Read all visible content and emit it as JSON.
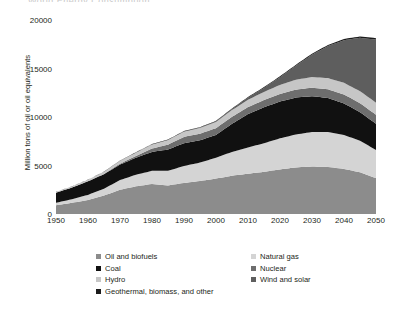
{
  "title_crop": "World Energy Consumption",
  "axis": {
    "ylabel": "Million tons of oil or oil equivalents",
    "yticks": [
      "0",
      "5000",
      "10000",
      "15000",
      "20000"
    ],
    "xticks": [
      "1950",
      "1960",
      "1970",
      "1980",
      "1990",
      "2000",
      "2010",
      "2020",
      "2030",
      "2040",
      "2050"
    ]
  },
  "legend": {
    "left": [
      {
        "label": "Oil and biofuels",
        "color": "#8c8c8c"
      },
      {
        "label": "Coal",
        "color": "#111111"
      },
      {
        "label": "Hydro",
        "color": "#c6c6c6"
      },
      {
        "label": "Geothermal, biomass, and other",
        "color": "#1c1c1c"
      }
    ],
    "right": [
      {
        "label": "Natural gas",
        "color": "#d4d4d4"
      },
      {
        "label": "Nuclear",
        "color": "#6e6e6e"
      },
      {
        "label": "Wind and solar",
        "color": "#5e5e5e"
      }
    ]
  },
  "chart_data": {
    "type": "area",
    "stacked": true,
    "title": "World Energy Consumption",
    "xlabel": "",
    "ylabel": "Million tons of oil or oil equivalents",
    "xlim": [
      1950,
      2050
    ],
    "ylim": [
      0,
      20000
    ],
    "grid": false,
    "legend_position": "bottom",
    "x": [
      1950,
      1955,
      1960,
      1965,
      1970,
      1975,
      1980,
      1985,
      1990,
      1995,
      2000,
      2005,
      2010,
      2015,
      2020,
      2025,
      2030,
      2035,
      2040,
      2045,
      2050
    ],
    "series": [
      {
        "name": "Oil and biofuels",
        "color": "#8c8c8c",
        "values": [
          900,
          1150,
          1450,
          1900,
          2500,
          2850,
          3100,
          2950,
          3200,
          3400,
          3650,
          3950,
          4150,
          4350,
          4600,
          4800,
          4900,
          4850,
          4650,
          4300,
          3700
        ]
      },
      {
        "name": "Natural gas",
        "color": "#d4d4d4",
        "values": [
          250,
          380,
          520,
          700,
          1000,
          1200,
          1350,
          1500,
          1750,
          1900,
          2150,
          2450,
          2700,
          2950,
          3200,
          3400,
          3550,
          3600,
          3500,
          3250,
          2900
        ]
      },
      {
        "name": "Coal",
        "color": "#111111",
        "values": [
          1050,
          1200,
          1400,
          1500,
          1600,
          1750,
          1950,
          2200,
          2350,
          2300,
          2350,
          2900,
          3450,
          3700,
          3800,
          3800,
          3700,
          3500,
          3250,
          2950,
          2700
        ]
      },
      {
        "name": "Nuclear",
        "color": "#6e6e6e",
        "values": [
          0,
          0,
          10,
          30,
          90,
          180,
          350,
          500,
          650,
          680,
          700,
          720,
          720,
          740,
          780,
          820,
          870,
          900,
          920,
          930,
          930
        ]
      },
      {
        "name": "Hydro",
        "color": "#c6c6c6",
        "values": [
          80,
          110,
          160,
          220,
          290,
          360,
          420,
          480,
          540,
          590,
          640,
          690,
          760,
          840,
          930,
          1020,
          1100,
          1160,
          1200,
          1230,
          1250
        ]
      },
      {
        "name": "Wind and solar",
        "color": "#5e5e5e",
        "values": [
          0,
          0,
          0,
          0,
          0,
          0,
          5,
          10,
          20,
          35,
          60,
          110,
          210,
          420,
          800,
          1450,
          2300,
          3300,
          4400,
          5500,
          6500
        ]
      },
      {
        "name": "Geothermal, biomass, and other",
        "color": "#1c1c1c",
        "values": [
          10,
          12,
          15,
          20,
          25,
          30,
          35,
          40,
          45,
          50,
          55,
          60,
          70,
          80,
          90,
          100,
          110,
          120,
          130,
          140,
          150
        ]
      }
    ],
    "totals": [
      2290,
      2852,
      3555,
      4370,
      5505,
      6370,
      7210,
      7680,
      8555,
      8955,
      9605,
      10880,
      12060,
      13080,
      14200,
      15390,
      16530,
      17430,
      18050,
      18300,
      18130
    ]
  }
}
